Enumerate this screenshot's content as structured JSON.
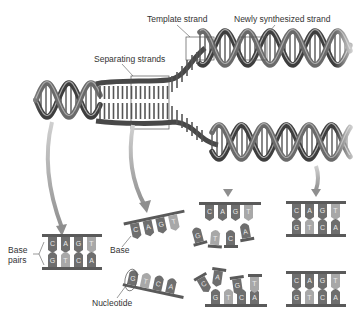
{
  "diagram": {
    "labels": {
      "template_strand": "Template strand",
      "newly_synthesized_strand": "Newly synthesized strand",
      "separating_strands": "Separating strands",
      "base_pairs_line1": "Base",
      "base_pairs_line2": "pairs",
      "base": "Base",
      "nucleotide": "Nucleotide"
    },
    "colors": {
      "backbone": "#5a5a5a",
      "helix_dark": "#4a4a4a",
      "helix_light": "#9a9a9a",
      "base_dark": "#6e6e6e",
      "base_light": "#a8a8a8",
      "arrow": "#a0a0a0",
      "callout": "#555555"
    },
    "panels": [
      {
        "id": "original-pair",
        "top_bases": [
          "C",
          "A",
          "G",
          "T"
        ],
        "bottom_bases": [
          "G",
          "T",
          "C",
          "A"
        ]
      },
      {
        "id": "separating-top",
        "top_bases": [
          "C",
          "A",
          "G",
          "T"
        ]
      },
      {
        "id": "separating-bottom",
        "bottom_bases": [
          "G",
          "T",
          "C",
          "A"
        ]
      },
      {
        "id": "replicating-top",
        "top_bases": [
          "C",
          "A",
          "G",
          "T"
        ],
        "incoming_bases": [
          "G",
          "T",
          "C",
          "A"
        ]
      },
      {
        "id": "replicating-bottom",
        "incoming_bases": [
          "C",
          "A",
          "G",
          "T"
        ],
        "bottom_bases": [
          "G",
          "T",
          "C",
          "A"
        ]
      },
      {
        "id": "daughter-top",
        "top_bases": [
          "C",
          "A",
          "G",
          "T"
        ],
        "bottom_bases": [
          "G",
          "T",
          "C",
          "A"
        ]
      },
      {
        "id": "daughter-bottom",
        "top_bases": [
          "C",
          "A",
          "G",
          "T"
        ],
        "bottom_bases": [
          "G",
          "T",
          "C",
          "A"
        ]
      }
    ]
  }
}
